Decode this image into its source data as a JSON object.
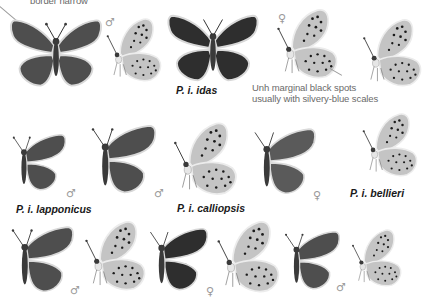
{
  "plate": {
    "annotations": {
      "top_left": "border narrow",
      "marginal_line1": "Unh marginal black spots",
      "marginal_line2": "usually with silvery-blue scales"
    },
    "labels": {
      "idas": "P. i. idas",
      "lapponicus": "P. i. lapponicus",
      "calliopsis": "P. i. calliopsis",
      "bellieri": "P. i. bellieri"
    },
    "symbols": {
      "male": "♂",
      "female": "♀"
    },
    "rows": [
      {
        "row": 1,
        "specimens": [
          {
            "view": "upperside",
            "sex": "male"
          },
          {
            "view": "underside",
            "sex": "male"
          },
          {
            "view": "upperside",
            "sex": "female",
            "subspecies": "P. i. idas"
          },
          {
            "view": "underside",
            "sex": "female"
          },
          {
            "view": "underside",
            "sex": "unknown",
            "partial": true
          }
        ]
      },
      {
        "row": 2,
        "specimens": [
          {
            "view": "upperside",
            "sex": "male",
            "subspecies": "P. i. lapponicus"
          },
          {
            "view": "upperside",
            "sex": "male"
          },
          {
            "view": "underside",
            "sex": "male",
            "subspecies": "P. i. calliopsis"
          },
          {
            "view": "upperside",
            "sex": "female"
          },
          {
            "view": "underside",
            "sex": "unknown",
            "subspecies": "P. i. bellieri"
          }
        ]
      },
      {
        "row": 3,
        "specimens": [
          {
            "view": "upperside",
            "sex": "male"
          },
          {
            "view": "underside",
            "sex": "unknown"
          },
          {
            "view": "upperside",
            "sex": "female"
          },
          {
            "view": "underside",
            "sex": "female"
          },
          {
            "view": "upperside",
            "sex": "male"
          },
          {
            "view": "underside",
            "sex": "male"
          }
        ]
      }
    ]
  }
}
